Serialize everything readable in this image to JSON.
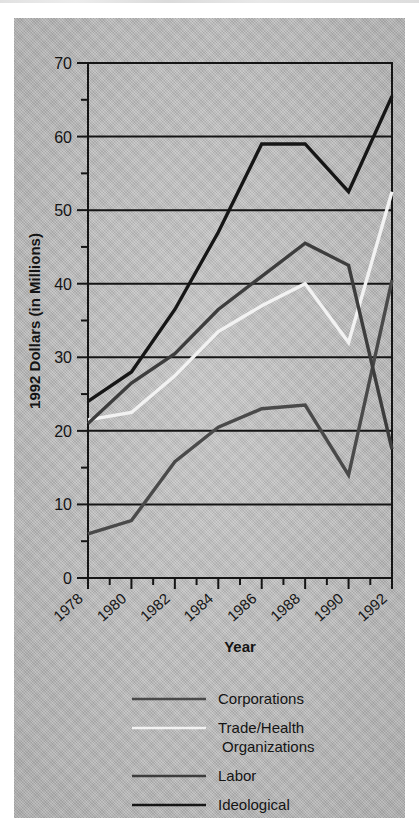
{
  "chart_data": {
    "type": "line",
    "title": "",
    "xlabel": "Year",
    "ylabel": "1992 Dollars (in Millions)",
    "x": [
      1978,
      1980,
      1982,
      1984,
      1986,
      1988,
      1990,
      1992
    ],
    "xlim": [
      1978,
      1992
    ],
    "ylim": [
      0,
      70
    ],
    "yticks": [
      0,
      10,
      20,
      30,
      40,
      50,
      60,
      70
    ],
    "xticks": [
      1978,
      1980,
      1982,
      1984,
      1986,
      1988,
      1990,
      1992
    ],
    "xtick_labels": [
      "1978",
      "1980",
      "1982",
      "1984",
      "1986",
      "1988",
      "1990",
      "1992"
    ],
    "ytick_labels": [
      "0",
      "10",
      "20",
      "30",
      "40",
      "50",
      "60",
      "70"
    ],
    "minor_xticks": [
      1979,
      1981,
      1983,
      1985,
      1987,
      1989,
      1991
    ],
    "minor_ytick_step": 5,
    "grid": "horizontal",
    "legend_position": "below",
    "series": [
      {
        "name": "Corporations",
        "color": "#4a4a4a",
        "values": [
          6.0,
          7.8,
          15.8,
          20.5,
          23.0,
          23.5,
          14.0,
          40.5
        ]
      },
      {
        "name": "Trade/Health Organizations",
        "color": "#f2f2f2",
        "values": [
          21.5,
          22.5,
          27.5,
          33.5,
          37.0,
          40.0,
          32.0,
          52.5
        ]
      },
      {
        "name": "Labor",
        "color": "#3d3d3d",
        "values": [
          21.0,
          26.5,
          30.5,
          36.5,
          41.0,
          45.5,
          42.5,
          17.5
        ]
      },
      {
        "name": "Ideological Organizations",
        "color": "#161616",
        "values": [
          24.0,
          28.0,
          36.5,
          47.0,
          59.0,
          59.0,
          52.5,
          65.5
        ]
      }
    ]
  },
  "axes": {
    "ylabel": "1992 Dollars (in Millions)",
    "xlabel": "Year"
  },
  "legend": {
    "items": [
      {
        "label": "Corporations",
        "label_line2": "",
        "color": "#4a4a4a"
      },
      {
        "label": "Trade/Health",
        "label_line2": "Organizations",
        "color": "#f2f2f2"
      },
      {
        "label": "Labor",
        "label_line2": "",
        "color": "#3d3d3d"
      },
      {
        "label": "Ideological",
        "label_line2": "Organizations",
        "color": "#161616"
      }
    ]
  },
  "colors": {
    "paper": "#b9b9b9",
    "ink": "#141414",
    "plot_border": "#151515"
  }
}
